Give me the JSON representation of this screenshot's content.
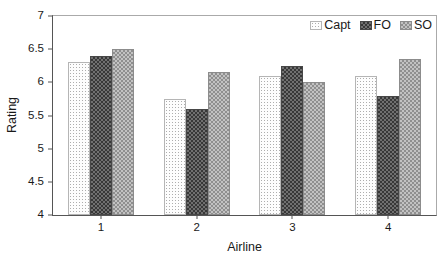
{
  "chart_data": {
    "type": "bar",
    "title": "",
    "xlabel": "Airline",
    "ylabel": "Rating",
    "categories": [
      "1",
      "2",
      "3",
      "4"
    ],
    "series": [
      {
        "name": "Capt",
        "pattern": "light-dots",
        "values": [
          6.3,
          5.75,
          6.1,
          6.1
        ]
      },
      {
        "name": "FO",
        "pattern": "dark-checker",
        "values": [
          6.4,
          5.6,
          6.25,
          5.8
        ]
      },
      {
        "name": "SO",
        "pattern": "gray-checker",
        "values": [
          6.5,
          6.15,
          6.0,
          6.35
        ]
      }
    ],
    "ylim": [
      4,
      7
    ],
    "yticks": [
      4,
      4.5,
      5,
      5.5,
      6,
      6.5,
      7
    ],
    "grid": false,
    "legend_position": "top-right",
    "bar_width_px": 22
  },
  "colors": {
    "background": "#ffffff",
    "axis_line": "#555555",
    "frame_line": "#aaaaaa",
    "text": "#1a1a1a",
    "capt_fill": "#fdfdfd",
    "capt_dot": "#adadad",
    "fo_base": "#707070",
    "fo_check": "#383838",
    "so_base": "#c2c2c2",
    "so_check": "#8f8f8f"
  }
}
